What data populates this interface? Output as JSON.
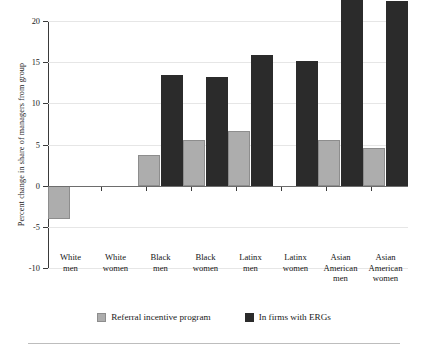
{
  "chart_data": {
    "type": "bar",
    "title": "",
    "xlabel": "",
    "ylabel": "Percent change in share of managers from group",
    "ylim": [
      -10,
      20
    ],
    "yticks": [
      20,
      15,
      10,
      5,
      0,
      -5,
      -10
    ],
    "ytick_labels": [
      "20",
      "15",
      "10",
      "5",
      "0",
      "-5",
      "-10"
    ],
    "grid": true,
    "grid_axis": "y",
    "legend_position": "bottom",
    "categories": [
      "White men",
      "White women",
      "Black men",
      "Black women",
      "Latinx men",
      "Latinx women",
      "Asian American men",
      "Asian American women"
    ],
    "category_lines": [
      [
        "White",
        "men"
      ],
      [
        "White",
        "women"
      ],
      [
        "Black",
        "men"
      ],
      [
        "Black",
        "women"
      ],
      [
        "Latinx",
        "men"
      ],
      [
        "Latinx",
        "women"
      ],
      [
        "Asian",
        "American",
        "men"
      ],
      [
        "Asian",
        "American",
        "women"
      ]
    ],
    "series": [
      {
        "name": "Referral incentive program",
        "color": "#adadad",
        "values": [
          -4.1,
          0,
          3.7,
          5.6,
          6.6,
          0,
          5.6,
          4.6
        ]
      },
      {
        "name": "In firms with ERGs",
        "color": "#2b2b2b",
        "values": [
          0,
          0,
          13.4,
          13.2,
          15.9,
          15.2,
          23.9,
          22.4
        ]
      }
    ]
  },
  "legend": {
    "entries": [
      {
        "label": "Referral incentive program",
        "swatch": "gray-swatch-icon"
      },
      {
        "label": "In firms with ERGs",
        "swatch": "dark-swatch-icon"
      }
    ]
  }
}
